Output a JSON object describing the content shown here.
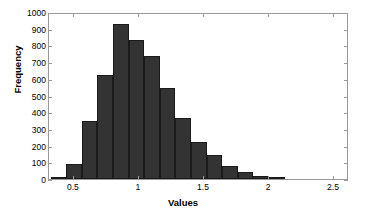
{
  "chart_data": {
    "type": "bar",
    "subtype": "histogram",
    "title": "",
    "xlabel": "Values",
    "ylabel": "Frequency",
    "xlim": [
      0.308,
      2.615
    ],
    "ylim": [
      0,
      1000
    ],
    "xticks": [
      0.5,
      1,
      1.5,
      2,
      2.5
    ],
    "xtick_labels": [
      "0.5",
      "1",
      "1.5",
      "2",
      "2.5"
    ],
    "yticks": [
      0,
      100,
      200,
      300,
      400,
      500,
      600,
      700,
      800,
      900,
      1000
    ],
    "ytick_labels": [
      "0",
      "100",
      "200",
      "300",
      "400",
      "500",
      "600",
      "700",
      "800",
      "900",
      "1000"
    ],
    "grid": false,
    "legend": false,
    "bin_width": 0.12,
    "bar_color": "#333333",
    "bar_edge_color": "#1a1a1a",
    "axis_color": "#9a9a9a",
    "background": "#ffffff",
    "bin_edges": [
      0.32,
      0.44,
      0.56,
      0.68,
      0.8,
      0.92,
      1.04,
      1.16,
      1.28,
      1.4,
      1.52,
      1.64,
      1.76,
      1.88,
      2.0,
      2.12
    ],
    "bin_centers": [
      0.38,
      0.5,
      0.62,
      0.74,
      0.86,
      0.98,
      1.1,
      1.22,
      1.34,
      1.46,
      1.58,
      1.7,
      1.82,
      1.94,
      2.06
    ],
    "values": [
      8,
      90,
      348,
      625,
      930,
      830,
      737,
      543,
      367,
      222,
      145,
      78,
      45,
      18,
      8
    ],
    "categories": [
      "0.38",
      "0.50",
      "0.62",
      "0.74",
      "0.86",
      "0.98",
      "1.10",
      "1.22",
      "1.34",
      "1.46",
      "1.58",
      "1.70",
      "1.82",
      "1.94",
      "2.06"
    ]
  }
}
